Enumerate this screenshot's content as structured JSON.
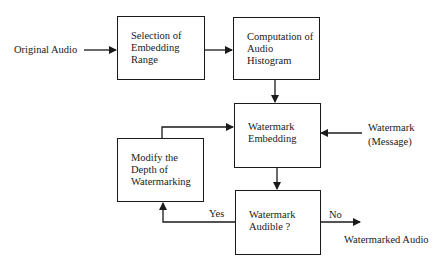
{
  "diagram": {
    "type": "flowchart",
    "nodes": [
      {
        "id": "selection",
        "lines": [
          "Selection of",
          "Embedding",
          "Range"
        ]
      },
      {
        "id": "histogram",
        "lines": [
          "Computation of",
          "Audio",
          "Histogram"
        ]
      },
      {
        "id": "embedding",
        "lines": [
          "Watermark",
          "Embedding"
        ]
      },
      {
        "id": "audible",
        "lines": [
          "Watermark",
          "Audible ?"
        ]
      },
      {
        "id": "modify",
        "lines": [
          "Modify the",
          "Depth of",
          "Watermarking"
        ]
      }
    ],
    "inputs": {
      "original_audio": "Original Audio",
      "watermark_message": [
        "Watermark",
        "(Message)"
      ]
    },
    "outputs": {
      "watermarked_audio": "Watermarked Audio"
    },
    "edge_labels": {
      "yes": "Yes",
      "no": "No"
    },
    "edges": [
      {
        "from": "Original Audio",
        "to": "selection"
      },
      {
        "from": "selection",
        "to": "histogram"
      },
      {
        "from": "histogram",
        "to": "embedding"
      },
      {
        "from": "Watermark (Message)",
        "to": "embedding"
      },
      {
        "from": "embedding",
        "to": "audible"
      },
      {
        "from": "audible",
        "to": "modify",
        "label": "Yes"
      },
      {
        "from": "modify",
        "to": "embedding"
      },
      {
        "from": "audible",
        "to": "Watermarked Audio",
        "label": "No"
      }
    ]
  }
}
